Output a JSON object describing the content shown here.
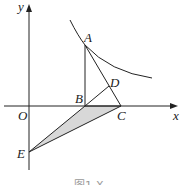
{
  "figure": {
    "caption": "图1-X",
    "axes": {
      "x_label": "x",
      "y_label": "y",
      "origin_label": "O"
    },
    "points": {
      "A": {
        "label": "A",
        "x": 85,
        "y": 45
      },
      "B": {
        "label": "B",
        "x": 85,
        "y": 106
      },
      "C": {
        "label": "C",
        "x": 121,
        "y": 106
      },
      "D": {
        "label": "D",
        "x": 109,
        "y": 86
      },
      "E": {
        "label": "E",
        "x": 29,
        "y": 152
      }
    },
    "shaded_region": "triangle BCE",
    "colors": {
      "line": "#222222",
      "shade": "#d8d8d8"
    }
  }
}
